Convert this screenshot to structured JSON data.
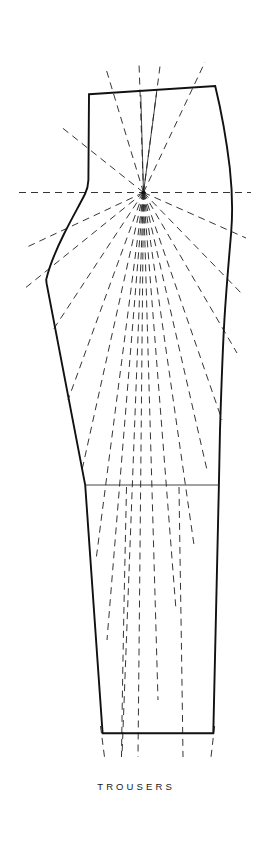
{
  "document": {
    "title": "Trousers",
    "background_color": "#ffffff",
    "canvas": {
      "width": 269,
      "height": 851
    }
  },
  "caption": {
    "text": "TROUSERS",
    "x": 0,
    "y": 781,
    "font_size": 9.5,
    "letter_spacing": 3.1,
    "color": "#1a1a1a"
  },
  "style": {
    "outline_color": "#111111",
    "outline_width": 1.9,
    "thin_line_color": "#222222",
    "thin_line_width": 0.85,
    "dashed_color": "#2a2a2a",
    "dashed_width": 0.95,
    "dash_pattern": "7,5",
    "hub_color": "#111111"
  },
  "pivot": {
    "label": "pivot-hub",
    "x": 143.5,
    "y": 192.5,
    "radius": 2.0
  },
  "outline": {
    "label": "trouser-front-block-outline",
    "path": "M 89.0 94.2 L 215.2 86.0 C 221.0 110.0 226.5 140.0 229.8 168.0 C 232.2 190.0 232.8 212.0 231.2 232.0 C 229.0 258.0 226.2 290.0 224.4 320.0 C 222.6 350.0 221.2 392.0 220.0 430.0 L 218.9 485.0 L 213.3 733.2 L 102.6 733.2 L 85.2 485.0 L 46.6 283.4 L 46.2 279.6 C 49.0 268.0 56.0 250.0 64.0 234.0 C 72.0 218.0 80.0 204.0 85.0 194.0 C 87.0 190.0 88.2 186.0 88.4 180.0 Z",
    "segments": [
      {
        "name": "waist-top-edge",
        "from": [
          89.0,
          94.2
        ],
        "to": [
          215.2,
          86.0
        ]
      },
      {
        "name": "side-seam-right",
        "from": [
          215.2,
          86.0
        ],
        "to": [
          218.9,
          485.0
        ]
      },
      {
        "name": "outseam-lower-right",
        "from": [
          218.9,
          485.0
        ],
        "to": [
          213.3,
          733.2
        ]
      },
      {
        "name": "hem-bottom-edge",
        "from": [
          213.3,
          733.2
        ],
        "to": [
          102.6,
          733.2
        ]
      },
      {
        "name": "inseam-lower-left",
        "from": [
          102.6,
          733.2
        ],
        "to": [
          85.2,
          485.0
        ]
      },
      {
        "name": "inseam-upper-left",
        "from": [
          85.2,
          485.0
        ],
        "to": [
          46.6,
          283.4
        ]
      },
      {
        "name": "crotch-curve",
        "from": [
          46.2,
          279.6
        ],
        "to": [
          88.4,
          180.0
        ]
      },
      {
        "name": "center-front-left",
        "from": [
          88.4,
          180.0
        ],
        "to": [
          89.0,
          94.2
        ]
      }
    ]
  },
  "knee_line": {
    "label": "knee-guide-line",
    "x1": 85.2,
    "y1": 485.0,
    "x2": 218.9,
    "y2": 485.0
  },
  "dart_lines": [
    {
      "name": "dart-leg-left",
      "x1": 140.8,
      "y1": 95.0,
      "x2": 143.5,
      "y2": 192.5
    },
    {
      "name": "dart-leg-right",
      "x1": 156.6,
      "y1": 92.9,
      "x2": 143.5,
      "y2": 192.5
    }
  ],
  "hip_line": {
    "label": "horizontal-hip-guide",
    "x1": 19.0,
    "y1": 192.5,
    "x2": 251.0,
    "y2": 192.5
  },
  "pivot_rays": [
    {
      "name": "ray-up-1",
      "x2": 139.0,
      "y2": 63.0
    },
    {
      "name": "ray-up-2",
      "x2": 160.5,
      "y2": 62.5
    },
    {
      "name": "ray-up-left",
      "x2": 106.5,
      "y2": 70.5
    },
    {
      "name": "ray-up-right",
      "x2": 205.0,
      "y2": 62.0
    },
    {
      "name": "ray-left-up",
      "x2": 60.0,
      "y2": 126.0
    },
    {
      "name": "ray-left-mid",
      "x2": 27.0,
      "y2": 247.0
    },
    {
      "name": "ray-left-low",
      "x2": 24.0,
      "y2": 289.0
    },
    {
      "name": "ray-left-diag",
      "x2": 53.0,
      "y2": 330.0
    },
    {
      "name": "ray-right-down1",
      "x2": 246.0,
      "y2": 238.0
    },
    {
      "name": "ray-right-down2",
      "x2": 243.0,
      "y2": 295.0
    },
    {
      "name": "ray-right-down3",
      "x2": 237.0,
      "y2": 353.0
    },
    {
      "name": "ray-down-1",
      "x2": 68.0,
      "y2": 400.0
    },
    {
      "name": "ray-down-2",
      "x2": 82.0,
      "y2": 470.0
    },
    {
      "name": "ray-down-3",
      "x2": 96.0,
      "y2": 560.0
    },
    {
      "name": "ray-down-4",
      "x2": 107.0,
      "y2": 640.0
    },
    {
      "name": "ray-down-5",
      "x2": 122.0,
      "y2": 756.0
    },
    {
      "name": "ray-down-6",
      "x2": 138.0,
      "y2": 757.0
    },
    {
      "name": "ray-down-7",
      "x2": 158.0,
      "y2": 700.0
    },
    {
      "name": "ray-down-8",
      "x2": 176.0,
      "y2": 610.0
    },
    {
      "name": "ray-down-9",
      "x2": 194.0,
      "y2": 545.0
    },
    {
      "name": "ray-down-10",
      "x2": 207.0,
      "y2": 470.0
    },
    {
      "name": "ray-down-11",
      "x2": 222.0,
      "y2": 420.0
    }
  ],
  "hem_extensions": [
    {
      "name": "hem-ext-left",
      "x1": 100.5,
      "y1": 726.0,
      "x2": 104.5,
      "y2": 757.0
    },
    {
      "name": "hem-ext-right",
      "x1": 214.6,
      "y1": 726.0,
      "x2": 211.0,
      "y2": 757.0
    }
  ],
  "leg_guides": [
    {
      "name": "leg-guide-inner",
      "path": "M 126.5 487.0 C 125.0 560.0 123.0 640.0 121.5 757.0"
    },
    {
      "name": "leg-guide-outer",
      "path": "M 179.0 487.0 C 180.0 560.0 181.5 640.0 183.0 757.0"
    }
  ]
}
